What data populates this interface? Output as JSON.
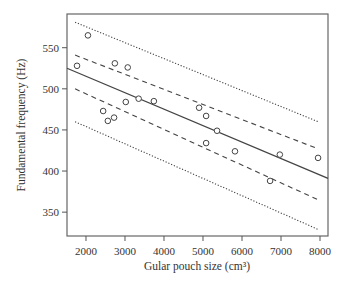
{
  "chart_data": {
    "type": "scatter",
    "title": "",
    "xlabel": "Gular pouch size (cm³)",
    "ylabel": "Fundamental frequency (Hz)",
    "xlim": [
      1513,
      8205
    ],
    "ylim": [
      321,
      591
    ],
    "xticks": [
      2000,
      3000,
      4000,
      5000,
      6000,
      7000,
      8000
    ],
    "yticks": [
      350,
      400,
      450,
      500,
      550
    ],
    "grid": false,
    "legend": "none",
    "points": [
      {
        "x": 1770,
        "y": 528
      },
      {
        "x": 2050,
        "y": 565
      },
      {
        "x": 2440,
        "y": 473
      },
      {
        "x": 2560,
        "y": 461
      },
      {
        "x": 2720,
        "y": 465
      },
      {
        "x": 2740,
        "y": 531
      },
      {
        "x": 3020,
        "y": 484
      },
      {
        "x": 3070,
        "y": 526
      },
      {
        "x": 3350,
        "y": 488
      },
      {
        "x": 3740,
        "y": 485
      },
      {
        "x": 4900,
        "y": 477
      },
      {
        "x": 5080,
        "y": 467
      },
      {
        "x": 5080,
        "y": 434
      },
      {
        "x": 5360,
        "y": 449
      },
      {
        "x": 5820,
        "y": 424
      },
      {
        "x": 6720,
        "y": 388
      },
      {
        "x": 6970,
        "y": 420
      },
      {
        "x": 7950,
        "y": 416
      }
    ],
    "lines": [
      {
        "name": "regression",
        "style": "solid",
        "x": [
          1513,
          8205
        ],
        "y": [
          525,
          391
        ]
      },
      {
        "name": "confidence-upper",
        "style": "dashed",
        "x": [
          1720,
          7950
        ],
        "y": [
          541,
          427
        ]
      },
      {
        "name": "confidence-lower",
        "style": "dashed",
        "x": [
          1720,
          7950
        ],
        "y": [
          500,
          365
        ]
      },
      {
        "name": "prediction-upper",
        "style": "dotted",
        "x": [
          1720,
          7950
        ],
        "y": [
          581,
          460
        ]
      },
      {
        "name": "prediction-lower",
        "style": "dotted",
        "x": [
          1720,
          7950
        ],
        "y": [
          460,
          329
        ]
      }
    ],
    "colors": {
      "axis": "#555555",
      "marks": "#444444",
      "text": "#333333"
    }
  }
}
